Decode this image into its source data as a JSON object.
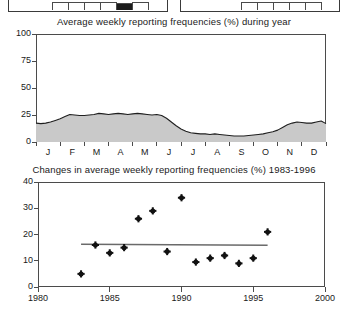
{
  "top_cropped_panels": {
    "description": "bottom edges of two cut-off panels",
    "left_panel": {
      "bars": [
        0,
        0,
        0,
        0,
        1,
        0
      ]
    },
    "right_panel": {
      "bars": [
        0,
        0,
        0,
        0,
        0
      ]
    }
  },
  "chart_data": [
    {
      "id": "seasonal-area-chart",
      "type": "area",
      "title": "Average weekly reporting frequencies (%) during year",
      "xlabel": "",
      "ylabel": "",
      "ylim": [
        0,
        100
      ],
      "yticks": [
        0,
        25,
        50,
        75,
        100
      ],
      "ytick_labels": [
        "0",
        "25",
        "50",
        "75",
        "100"
      ],
      "categories": [
        "J",
        "F",
        "M",
        "A",
        "M",
        "J",
        "J",
        "A",
        "S",
        "O",
        "N",
        "D"
      ],
      "xtick_labels": [
        "J",
        "F",
        "M",
        "A",
        "M",
        "J",
        "J",
        "A",
        "S",
        "O",
        "N",
        "D"
      ],
      "grid": false,
      "legend": "none",
      "fill_color": "#c9c9c9",
      "line_color": "#1f1f1f",
      "x": [
        0.0,
        0.2,
        0.4,
        0.6,
        0.8,
        1.0,
        1.2,
        1.4,
        1.6,
        1.8,
        2.0,
        2.2,
        2.4,
        2.6,
        2.8,
        3.0,
        3.2,
        3.4,
        3.6,
        3.8,
        4.0,
        4.2,
        4.4,
        4.6,
        4.8,
        5.0,
        5.2,
        5.4,
        5.6,
        5.8,
        6.0,
        6.2,
        6.4,
        6.6,
        6.8,
        7.0,
        7.2,
        7.4,
        7.6,
        7.8,
        8.0,
        8.2,
        8.4,
        8.6,
        8.8,
        9.0,
        9.2,
        9.4,
        9.6,
        9.8,
        10.0,
        10.2,
        10.4,
        10.6,
        10.8,
        11.0,
        11.2,
        11.4,
        11.6,
        11.8,
        12.0
      ],
      "values": [
        17.5,
        17.0,
        17.5,
        18.5,
        20.0,
        21.5,
        23.5,
        25.5,
        25.0,
        24.5,
        24.5,
        25.0,
        25.5,
        26.5,
        26.0,
        25.5,
        26.0,
        26.5,
        26.0,
        25.5,
        26.0,
        26.5,
        26.0,
        25.5,
        25.0,
        25.5,
        24.5,
        22.0,
        18.5,
        15.0,
        12.0,
        10.0,
        8.5,
        8.0,
        7.5,
        7.5,
        7.0,
        7.5,
        7.0,
        6.5,
        6.0,
        5.5,
        5.5,
        5.5,
        6.0,
        6.5,
        7.0,
        7.5,
        8.5,
        9.5,
        11.0,
        13.5,
        16.0,
        17.5,
        18.5,
        18.0,
        17.5,
        17.5,
        18.5,
        19.5,
        17.0
      ]
    },
    {
      "id": "yearly-change-scatter",
      "type": "scatter",
      "title": "Changes in average weekly reporting frequencies (%) 1983-1996",
      "xlabel": "",
      "ylabel": "",
      "xlim": [
        1980,
        2000
      ],
      "ylim": [
        0,
        40
      ],
      "xticks": [
        1980,
        1985,
        1990,
        1995,
        2000
      ],
      "xtick_labels": [
        "1980",
        "1985",
        "1990",
        "1995",
        "2000"
      ],
      "yticks": [
        0,
        10,
        20,
        30,
        40
      ],
      "ytick_labels": [
        "0",
        "10",
        "20",
        "30",
        "40"
      ],
      "grid": false,
      "legend": "none",
      "marker_color": "#111111",
      "trend_color": "#6a6a6a",
      "points": [
        {
          "x": 1983,
          "y": 5.0
        },
        {
          "x": 1984,
          "y": 16.0
        },
        {
          "x": 1985,
          "y": 13.0
        },
        {
          "x": 1986,
          "y": 15.0
        },
        {
          "x": 1987,
          "y": 26.0
        },
        {
          "x": 1988,
          "y": 29.0
        },
        {
          "x": 1989,
          "y": 13.5
        },
        {
          "x": 1990,
          "y": 34.0
        },
        {
          "x": 1991,
          "y": 9.5
        },
        {
          "x": 1992,
          "y": 11.0
        },
        {
          "x": 1993,
          "y": 12.0
        },
        {
          "x": 1994,
          "y": 9.0
        },
        {
          "x": 1995,
          "y": 11.0
        },
        {
          "x": 1996,
          "y": 21.0
        }
      ],
      "trend_line": {
        "x_start": 1983,
        "y_start": 16.3,
        "x_end": 1996,
        "y_end": 15.9
      }
    }
  ]
}
